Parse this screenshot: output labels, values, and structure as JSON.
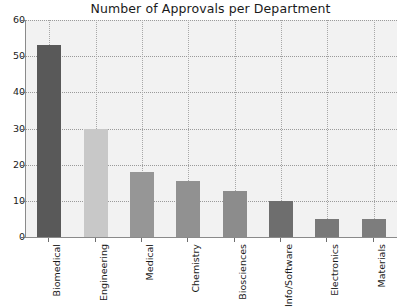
{
  "chart_data": {
    "type": "bar",
    "title": "Number of Approvals per Department",
    "xlabel": "",
    "ylabel": "",
    "categories": [
      "Biomedical",
      "Engineering",
      "Medical",
      "Chemistry",
      "Biosciences",
      "Info/Software",
      "Electronics",
      "Materials"
    ],
    "values": [
      53,
      30,
      18,
      15.5,
      12.8,
      10,
      5,
      5
    ],
    "bar_colors": [
      "#595959",
      "#c8c8c8",
      "#969696",
      "#919191",
      "#8c8c8c",
      "#6e6e6e",
      "#787878",
      "#7d7d7d"
    ],
    "ylim": [
      0,
      60
    ],
    "yticks": [
      0,
      10,
      20,
      30,
      40,
      50,
      60
    ],
    "ytick_labels": [
      "0",
      "10",
      "20",
      "30",
      "40",
      "50",
      "60"
    ],
    "grid": true,
    "grid_style": "dotted",
    "legend": null,
    "plot_background": "#f2f2f2",
    "figure_background": "#ffffff"
  }
}
